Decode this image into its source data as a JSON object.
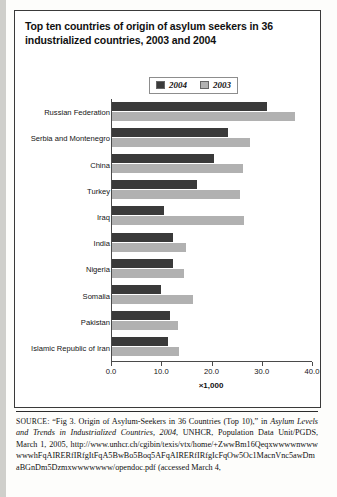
{
  "figure": {
    "title": "Top ten countries of origin of asylum seekers in 36 industrialized countries, 2003 and 2004",
    "x_axis_title": "×1,000",
    "legend": [
      {
        "label": "2004",
        "color": "#3a3a3a",
        "icon": "legend-swatch-dark"
      },
      {
        "label": "2003",
        "color": "#b1b1b1",
        "icon": "legend-swatch-light"
      }
    ]
  },
  "source": {
    "label": "SOURCE",
    "text_1": ": “Fig 3. Origin of Asylum-Seekers in 36 Countries (Top 10),” in ",
    "italic_title": "Asylum Levels and Trends in Industrialized Countries, 2004",
    "text_2": ", UNHCR, Population Data Unit/PGDS, March 1, 2005, ",
    "url": "http://www.unhcr.ch/cgibin/texis/vtx/home/+ZwwBm16QeqxwwwwnwwwwwwhFqAIRERfIRfgItFqA5BwBo5Boq5AFqAIRERfIRfgIcFqOw5Oc1MacnVnc5awDmaBGnDm5Dzmxwwwwwww/opendoc.pdf",
    "text_3": " (accessed March 4,"
  },
  "chart_data": {
    "type": "bar",
    "orientation": "horizontal",
    "title": "Top ten countries of origin of asylum seekers in 36 industrialized countries, 2003 and 2004",
    "xlabel": "×1,000",
    "ylabel": "",
    "xlim": [
      0.0,
      40.0
    ],
    "xticks": [
      "0.0",
      "10.0",
      "20.0",
      "30.0",
      "40.0"
    ],
    "xtick_values": [
      0.0,
      10.0,
      20.0,
      30.0,
      40.0
    ],
    "grid": false,
    "legend_position": "top-center",
    "categories": [
      "Russian Federation",
      "Serbia and Montenegro",
      "China",
      "Turkey",
      "Iraq",
      "India",
      "Nigeria",
      "Somalia",
      "Pakistan",
      "Islamic Republic of Iran"
    ],
    "series": [
      {
        "name": "2004",
        "color": "#3a3a3a",
        "values": [
          30.8,
          23.0,
          20.2,
          17.0,
          10.4,
          12.2,
          12.2,
          9.8,
          11.6,
          11.2
        ]
      },
      {
        "name": "2003",
        "color": "#b1b1b1",
        "values": [
          36.4,
          27.4,
          26.0,
          25.4,
          26.2,
          14.8,
          14.4,
          16.2,
          13.2,
          13.4
        ]
      }
    ]
  }
}
